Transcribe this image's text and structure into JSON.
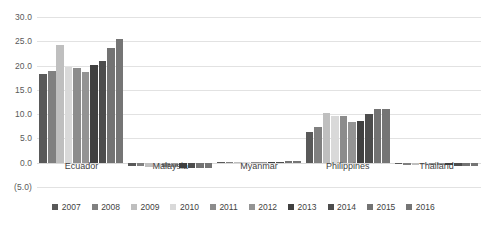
{
  "chart_data": {
    "type": "bar",
    "title": "",
    "xlabel": "",
    "ylabel": "",
    "ylim": [
      -5.0,
      30.0
    ],
    "yticks": [
      "30.0",
      "25.0",
      "20.0",
      "15.0",
      "10.0",
      "5.0",
      "0.0",
      "(5.0)"
    ],
    "ytick_values": [
      30.0,
      25.0,
      20.0,
      15.0,
      10.0,
      5.0,
      0.0,
      -5.0
    ],
    "grid": true,
    "legend_position": "bottom",
    "categories": [
      "Ecuador",
      "Malaysia",
      "Myanmar",
      "Philippines",
      "Thailand"
    ],
    "series": [
      {
        "name": "2007",
        "color": "#595959",
        "values": [
          18.2,
          -0.7,
          0.1,
          6.4,
          -0.3
        ]
      },
      {
        "name": "2008",
        "color": "#808080",
        "values": [
          18.8,
          -0.7,
          0.1,
          7.4,
          -0.4
        ]
      },
      {
        "name": "2009",
        "color": "#bfbfbf",
        "values": [
          24.3,
          -0.8,
          0.1,
          10.3,
          -0.4
        ]
      },
      {
        "name": "2010",
        "color": "#d9d9d9",
        "values": [
          19.8,
          -0.8,
          0.1,
          9.6,
          -0.4
        ]
      },
      {
        "name": "2011",
        "color": "#8c8c8c",
        "values": [
          19.5,
          -0.9,
          0.1,
          9.6,
          -0.5
        ]
      },
      {
        "name": "2012",
        "color": "#949494",
        "values": [
          18.7,
          -0.9,
          0.1,
          8.4,
          -0.5
        ]
      },
      {
        "name": "2013",
        "color": "#404040",
        "values": [
          20.1,
          -1.0,
          0.1,
          8.5,
          -0.5
        ]
      },
      {
        "name": "2014",
        "color": "#4d4d4d",
        "values": [
          20.9,
          -1.0,
          0.1,
          10.0,
          -0.6
        ]
      },
      {
        "name": "2015",
        "color": "#737373",
        "values": [
          23.6,
          -1.1,
          0.3,
          11.1,
          -0.6
        ]
      },
      {
        "name": "2016",
        "color": "#757575",
        "values": [
          25.4,
          -1.1,
          0.3,
          11.0,
          -0.7
        ]
      }
    ]
  },
  "legend": {
    "items": [
      {
        "label": "2007"
      },
      {
        "label": "2008"
      },
      {
        "label": "2009"
      },
      {
        "label": "2010"
      },
      {
        "label": "2011"
      },
      {
        "label": "2012"
      },
      {
        "label": "2013"
      },
      {
        "label": "2014"
      },
      {
        "label": "2015"
      },
      {
        "label": "2016"
      }
    ]
  }
}
